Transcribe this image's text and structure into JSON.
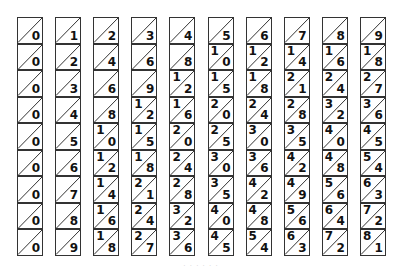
{
  "colors": {
    "line": "#333333",
    "text": "#111111",
    "background": "#ffffff"
  },
  "rods": [
    {
      "digit": 0,
      "cells": [
        [
          "",
          "0"
        ],
        [
          "",
          "0"
        ],
        [
          "",
          "0"
        ],
        [
          "",
          "0"
        ],
        [
          "",
          "0"
        ],
        [
          "",
          "0"
        ],
        [
          "",
          "0"
        ],
        [
          "",
          "0"
        ],
        [
          "",
          "0"
        ]
      ]
    },
    {
      "digit": 1,
      "cells": [
        [
          "",
          "1"
        ],
        [
          "",
          "2"
        ],
        [
          "",
          "3"
        ],
        [
          "",
          "4"
        ],
        [
          "",
          "5"
        ],
        [
          "",
          "6"
        ],
        [
          "",
          "7"
        ],
        [
          "",
          "8"
        ],
        [
          "",
          "9"
        ]
      ]
    },
    {
      "digit": 2,
      "cells": [
        [
          "",
          "2"
        ],
        [
          "",
          "4"
        ],
        [
          "",
          "6"
        ],
        [
          "",
          "8"
        ],
        [
          "1",
          "0"
        ],
        [
          "1",
          "2"
        ],
        [
          "1",
          "4"
        ],
        [
          "1",
          "6"
        ],
        [
          "1",
          "8"
        ]
      ]
    },
    {
      "digit": 3,
      "cells": [
        [
          "",
          "3"
        ],
        [
          "",
          "6"
        ],
        [
          "",
          "9"
        ],
        [
          "1",
          "2"
        ],
        [
          "1",
          "5"
        ],
        [
          "1",
          "8"
        ],
        [
          "2",
          "1"
        ],
        [
          "2",
          "4"
        ],
        [
          "2",
          "7"
        ]
      ]
    },
    {
      "digit": 4,
      "cells": [
        [
          "",
          "4"
        ],
        [
          "",
          "8"
        ],
        [
          "1",
          "2"
        ],
        [
          "1",
          "6"
        ],
        [
          "2",
          "0"
        ],
        [
          "2",
          "4"
        ],
        [
          "2",
          "8"
        ],
        [
          "3",
          "2"
        ],
        [
          "3",
          "6"
        ]
      ]
    },
    {
      "digit": 5,
      "cells": [
        [
          "",
          "5"
        ],
        [
          "1",
          "0"
        ],
        [
          "1",
          "5"
        ],
        [
          "2",
          "0"
        ],
        [
          "2",
          "5"
        ],
        [
          "3",
          "0"
        ],
        [
          "3",
          "5"
        ],
        [
          "4",
          "0"
        ],
        [
          "4",
          "5"
        ]
      ]
    },
    {
      "digit": 6,
      "cells": [
        [
          "",
          "6"
        ],
        [
          "1",
          "2"
        ],
        [
          "1",
          "8"
        ],
        [
          "2",
          "4"
        ],
        [
          "3",
          "0"
        ],
        [
          "3",
          "6"
        ],
        [
          "4",
          "2"
        ],
        [
          "4",
          "8"
        ],
        [
          "5",
          "4"
        ]
      ]
    },
    {
      "digit": 7,
      "cells": [
        [
          "",
          "7"
        ],
        [
          "1",
          "4"
        ],
        [
          "2",
          "1"
        ],
        [
          "2",
          "8"
        ],
        [
          "3",
          "5"
        ],
        [
          "4",
          "2"
        ],
        [
          "4",
          "9"
        ],
        [
          "5",
          "6"
        ],
        [
          "6",
          "3"
        ]
      ]
    },
    {
      "digit": 8,
      "cells": [
        [
          "",
          "8"
        ],
        [
          "1",
          "6"
        ],
        [
          "2",
          "4"
        ],
        [
          "3",
          "2"
        ],
        [
          "4",
          "0"
        ],
        [
          "4",
          "8"
        ],
        [
          "5",
          "6"
        ],
        [
          "6",
          "4"
        ],
        [
          "7",
          "2"
        ]
      ]
    },
    {
      "digit": 9,
      "cells": [
        [
          "",
          "9"
        ],
        [
          "1",
          "8"
        ],
        [
          "2",
          "7"
        ],
        [
          "3",
          "6"
        ],
        [
          "4",
          "5"
        ],
        [
          "5",
          "4"
        ],
        [
          "6",
          "3"
        ],
        [
          "7",
          "2"
        ],
        [
          "8",
          "1"
        ]
      ]
    }
  ],
  "caption": "· · · · · ·"
}
